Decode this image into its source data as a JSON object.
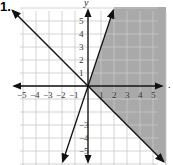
{
  "problem": {
    "number": "1."
  },
  "chart_data": {
    "type": "line",
    "title": "",
    "xlabel": "",
    "ylabel": "y",
    "xlim": [
      -6,
      6
    ],
    "ylim": [
      -6,
      6
    ],
    "grid": true,
    "x_ticks": [
      "-5",
      "-4",
      "-3",
      "-2",
      "-1",
      "1",
      "2",
      "3",
      "4",
      "5"
    ],
    "y_ticks": [
      "5",
      "4",
      "3",
      "2",
      "1",
      "-3",
      "-4",
      "-5"
    ],
    "series": [
      {
        "name": "y = -x",
        "slope": -1,
        "intercept": 0,
        "style": "solid",
        "arrows": "both"
      },
      {
        "name": "y = 3x",
        "slope": 3,
        "intercept": 0,
        "style": "solid",
        "arrows": "both"
      }
    ],
    "shaded_region": {
      "description": "region to the right of y = 3x and above y = -x",
      "inequalities": [
        "y <= 3x",
        "y >= -x"
      ],
      "color": "#a9a9a9"
    }
  },
  "labels": {
    "y_axis": "y",
    "trailing_mark": "."
  }
}
